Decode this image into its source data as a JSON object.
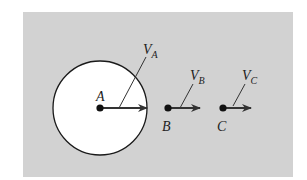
{
  "diagram": {
    "background": "#d2d2d2",
    "disk_fill": "#ffffff",
    "stroke": "#1a1a1a",
    "arrow_color": "#333333",
    "points": [
      {
        "id": "A",
        "label": "A",
        "velocity_label": "V",
        "velocity_sub": "A"
      },
      {
        "id": "B",
        "label": "B",
        "velocity_label": "V",
        "velocity_sub": "B"
      },
      {
        "id": "C",
        "label": "C",
        "velocity_label": "V",
        "velocity_sub": "C"
      }
    ]
  }
}
